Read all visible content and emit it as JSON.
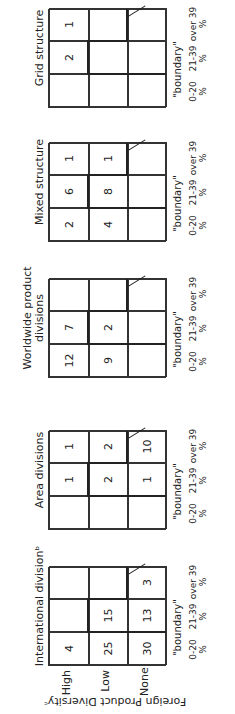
{
  "chart_data": {
    "type": "table",
    "title": "",
    "ylabel": "Foreign Product Diversity",
    "ylabel_footnote": "c",
    "row_labels": [
      "High",
      "Low",
      "None"
    ],
    "column_labels": [
      "0-20 %",
      "21-39 %",
      "over 39 %"
    ],
    "boundary_label": "\"boundary\"",
    "panels": [
      {
        "title": "International division",
        "title_footnote": "b",
        "values": [
          [
            "4",
            "",
            ""
          ],
          [
            "25",
            "15",
            ""
          ],
          [
            "30",
            "13",
            "3"
          ]
        ]
      },
      {
        "title": "Area divisions",
        "values": [
          [
            "",
            "1",
            "1"
          ],
          [
            "",
            "2",
            "2"
          ],
          [
            "",
            "1",
            "10"
          ]
        ]
      },
      {
        "title": "Worldwide product divisions",
        "values": [
          [
            "12",
            "7",
            ""
          ],
          [
            "9",
            "2",
            ""
          ],
          [
            "",
            "",
            ""
          ]
        ]
      },
      {
        "title": "Mixed structure",
        "values": [
          [
            "2",
            "6",
            "1"
          ],
          [
            "4",
            "8",
            "1"
          ],
          [
            "",
            "",
            ""
          ]
        ]
      },
      {
        "title": "Grid structure",
        "values": [
          [
            "",
            "2",
            "1"
          ],
          [
            "",
            "",
            ""
          ],
          [
            "",
            "",
            ""
          ]
        ]
      }
    ],
    "orientation": "rotated 90 degrees counter-clockwise"
  },
  "labels": {
    "axis_title": "Foreign Product Diversityᶜ",
    "high": "High",
    "low": "Low",
    "none": "None",
    "col0a": "0-20",
    "col1a": "21-39",
    "col2a": "over 39",
    "pct": "%",
    "boundary": "\"boundary\"",
    "p0": "International divisionᵇ",
    "p1": "Area divisions",
    "p2": "Worldwide product divisions",
    "p3": "Mixed structure",
    "p4": "Grid structure"
  },
  "cells": {
    "p0": [
      "4",
      "",
      "",
      "25",
      "15",
      "",
      "30",
      "13",
      "3"
    ],
    "p1": [
      "",
      "1",
      "1",
      "",
      "2",
      "2",
      "",
      "1",
      "10"
    ],
    "p2": [
      "12",
      "7",
      "",
      "9",
      "2",
      "",
      "",
      "",
      ""
    ],
    "p3": [
      "2",
      "6",
      "1",
      "4",
      "8",
      "1",
      "",
      "",
      ""
    ],
    "p4": [
      "",
      "2",
      "1",
      "",
      "",
      "",
      "",
      "",
      ""
    ]
  }
}
